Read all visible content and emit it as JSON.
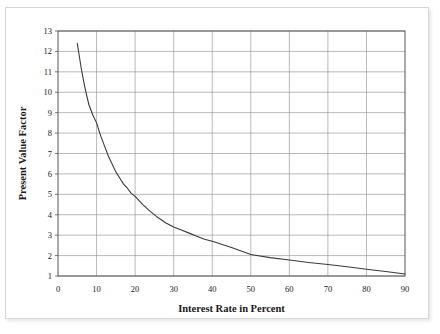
{
  "figure": {
    "background_color": "#ffffff",
    "border_color": "#d8d8d8"
  },
  "chart_data": {
    "type": "line",
    "title": "",
    "xlabel": "Interest Rate in Percent",
    "ylabel": "Present Value Factor",
    "xlim": [
      0,
      90
    ],
    "ylim": [
      1,
      13
    ],
    "xticks": [
      0,
      10,
      20,
      30,
      40,
      50,
      60,
      70,
      80,
      90
    ],
    "xtick_labels": [
      "0",
      "10",
      "20",
      "30",
      "40",
      "50",
      "60",
      "70",
      "80",
      "90"
    ],
    "yticks": [
      1,
      2,
      3,
      4,
      5,
      6,
      7,
      8,
      9,
      10,
      11,
      12,
      13
    ],
    "ytick_labels": [
      "1",
      "2",
      "3",
      "4",
      "5",
      "6",
      "7",
      "8",
      "9",
      "10",
      "11",
      "12",
      "13"
    ],
    "grid": true,
    "grid_color": "#8c8c8c",
    "legend": false,
    "legend_position": "none",
    "line_color": "#3a3a3a",
    "series": [
      {
        "name": "Present Value Factor",
        "x": [
          5,
          6,
          7,
          8,
          9,
          10,
          11,
          12,
          13,
          14,
          15,
          16,
          17,
          18,
          19,
          20,
          22,
          24,
          26,
          28,
          30,
          32,
          34,
          36,
          38,
          40,
          45,
          50,
          55,
          60,
          65,
          70,
          75,
          80,
          85,
          90
        ],
        "y": [
          12.4,
          11.2,
          10.2,
          9.4,
          8.9,
          8.5,
          7.9,
          7.4,
          6.9,
          6.5,
          6.1,
          5.8,
          5.5,
          5.3,
          5.05,
          4.9,
          4.5,
          4.15,
          3.85,
          3.6,
          3.4,
          3.25,
          3.1,
          2.95,
          2.8,
          2.7,
          2.4,
          2.05,
          1.9,
          1.78,
          1.66,
          1.56,
          1.45,
          1.33,
          1.22,
          1.1
        ]
      }
    ]
  },
  "axis_labels": {
    "x_title": "Interest Rate in Percent",
    "y_title": "Present Value Factor"
  }
}
